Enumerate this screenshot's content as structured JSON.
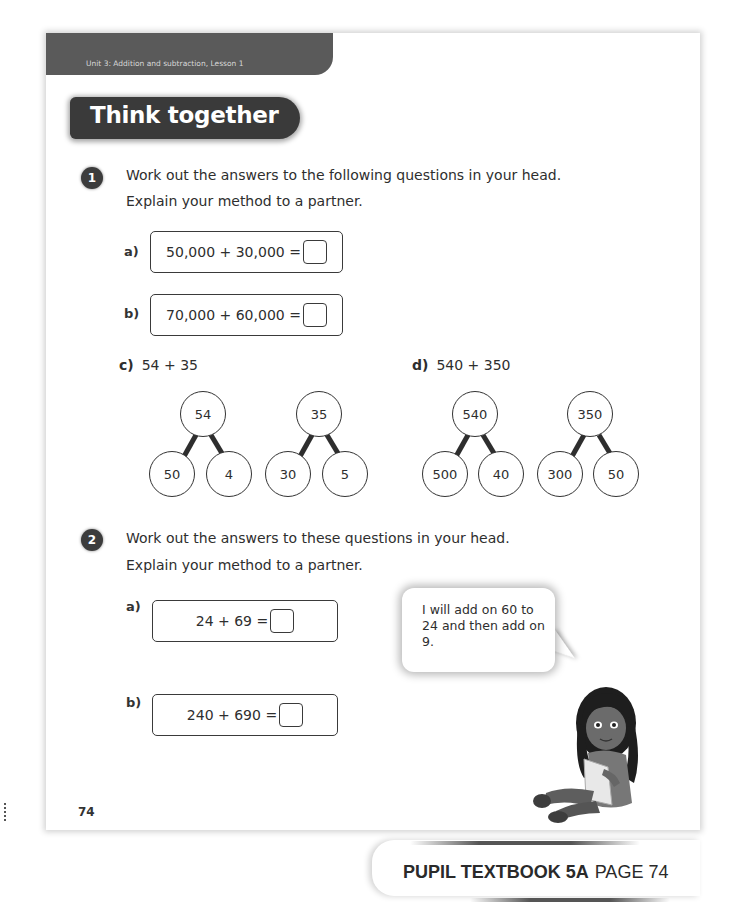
{
  "header": {
    "unit_text": "Unit 3: Addition and subtraction, Lesson 1",
    "section_title": "Think together"
  },
  "question1": {
    "number": "1",
    "line1": "Work out the answers to the following questions in your head.",
    "line2": "Explain your method to a partner.",
    "parts": [
      {
        "label": "a)",
        "expression": "50,000 + 30,000 ="
      },
      {
        "label": "b)",
        "expression": "70,000 + 60,000 ="
      }
    ],
    "part_c": {
      "label": "c)",
      "expression": "54 + 35",
      "trees": [
        {
          "whole": "54",
          "parts": [
            "50",
            "4"
          ]
        },
        {
          "whole": "35",
          "parts": [
            "30",
            "5"
          ]
        }
      ]
    },
    "part_d": {
      "label": "d)",
      "expression": "540 + 350",
      "trees": [
        {
          "whole": "540",
          "parts": [
            "500",
            "40"
          ]
        },
        {
          "whole": "350",
          "parts": [
            "300",
            "50"
          ]
        }
      ]
    }
  },
  "question2": {
    "number": "2",
    "line1": "Work out the answers to these questions in your head.",
    "line2": "Explain your method to a partner.",
    "parts": [
      {
        "label": "a)",
        "expression": "24 + 69 ="
      },
      {
        "label": "b)",
        "expression": "240 + 690 ="
      }
    ],
    "speech_bubble": "I will add on 60 to 24 and then add on 9."
  },
  "footer": {
    "page_number": "74",
    "book_label": "PUPIL TEXTBOOK 5A",
    "page_label": "PAGE 74"
  },
  "colors": {
    "header_bar": "#5a5a5a",
    "title_pill": "#3a3a3a",
    "badge": "#3c3c3c",
    "text": "#2e2e2e"
  }
}
